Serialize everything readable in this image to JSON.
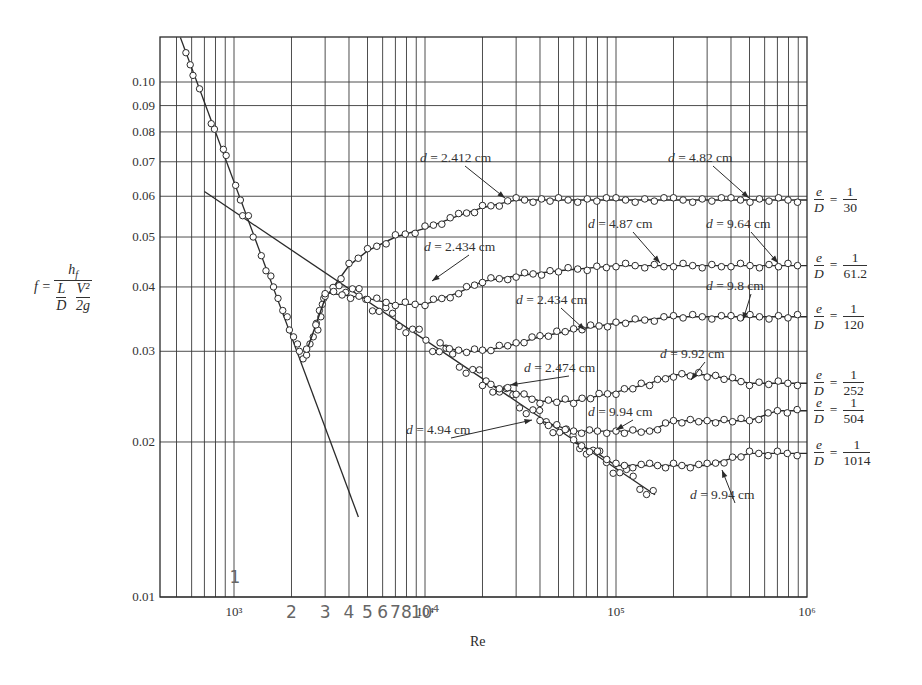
{
  "chart_data": {
    "type": "scatter",
    "title": "",
    "xlabel": "Re",
    "ylabel": "f = h_f / ((L/D)(V^2/2g))",
    "xscale": "log",
    "yscale": "log",
    "xlim": [
      410,
      1000000
    ],
    "ylim": [
      0.01,
      0.122
    ],
    "grid": true,
    "x_ticks": [
      {
        "value": 1000,
        "label": "10³"
      },
      {
        "value": 10000,
        "label": "10⁴"
      },
      {
        "value": 100000,
        "label": "10⁵"
      },
      {
        "value": 1000000,
        "label": "10⁶"
      }
    ],
    "y_ticks": [
      {
        "value": 0.01,
        "label": "0.01"
      },
      {
        "value": 0.02,
        "label": "0.02"
      },
      {
        "value": 0.03,
        "label": "0.03"
      },
      {
        "value": 0.04,
        "label": "0.04"
      },
      {
        "value": 0.05,
        "label": "0.05"
      },
      {
        "value": 0.06,
        "label": "0.06"
      },
      {
        "value": 0.07,
        "label": "0.07"
      },
      {
        "value": 0.08,
        "label": "0.08"
      },
      {
        "value": 0.09,
        "label": "0.09"
      },
      {
        "value": 0.1,
        "label": "0.10"
      }
    ],
    "handwritten_x_marks": [
      "1",
      "2",
      "3",
      "4",
      "5",
      "6",
      "7",
      "8",
      "10⁴"
    ],
    "reference_lines": [
      {
        "name": "laminar f = 64/Re",
        "x": [
          524,
          4480
        ],
        "y": [
          0.122,
          0.0143
        ]
      },
      {
        "name": "Blasius smooth pipe",
        "x": [
          700,
          160000
        ],
        "y": [
          0.0613,
          0.0158
        ]
      }
    ],
    "series": [
      {
        "name": "e/D = 1/30",
        "rhs_num": "1",
        "rhs_den": "30",
        "x": [
          2400,
          3000,
          4000,
          5000,
          7000,
          10000,
          15000,
          20000,
          30000,
          50000,
          100000,
          200000,
          400000,
          1000000
        ],
        "y": [
          0.03,
          0.038,
          0.044,
          0.047,
          0.05,
          0.052,
          0.055,
          0.057,
          0.059,
          0.059,
          0.059,
          0.059,
          0.059,
          0.059
        ]
      },
      {
        "name": "e/D = 1/61.2",
        "rhs_num": "1",
        "rhs_den": "61.2",
        "x": [
          3000,
          5000,
          7000,
          10000,
          15000,
          20000,
          30000,
          50000,
          100000,
          200000,
          400000,
          1000000
        ],
        "y": [
          0.039,
          0.038,
          0.037,
          0.037,
          0.039,
          0.041,
          0.042,
          0.043,
          0.044,
          0.044,
          0.044,
          0.044
        ]
      },
      {
        "name": "e/D = 1/120",
        "rhs_num": "1",
        "rhs_den": "120",
        "x": [
          12000,
          15000,
          20000,
          30000,
          40000,
          60000,
          100000,
          200000,
          400000,
          1000000
        ],
        "y": [
          0.031,
          0.03,
          0.03,
          0.031,
          0.032,
          0.033,
          0.034,
          0.035,
          0.035,
          0.035
        ]
      },
      {
        "name": "e/D = 1/252",
        "rhs_num": "1",
        "rhs_den": "252",
        "x": [
          20000,
          30000,
          40000,
          60000,
          100000,
          150000,
          200000,
          300000,
          500000,
          1000000
        ],
        "y": [
          0.026,
          0.025,
          0.024,
          0.024,
          0.025,
          0.026,
          0.027,
          0.027,
          0.026,
          0.026
        ]
      },
      {
        "name": "e/D = 1/504",
        "rhs_num": "1",
        "rhs_den": "504",
        "x": [
          40000,
          60000,
          80000,
          100000,
          150000,
          200000,
          300000,
          500000,
          700000,
          1000000
        ],
        "y": [
          0.022,
          0.021,
          0.021,
          0.021,
          0.021,
          0.022,
          0.022,
          0.022,
          0.023,
          0.023
        ]
      },
      {
        "name": "e/D = 1/1014",
        "rhs_num": "1",
        "rhs_den": "1014",
        "x": [
          60000,
          80000,
          100000,
          150000,
          200000,
          300000,
          500000,
          700000,
          1000000
        ],
        "y": [
          0.02,
          0.019,
          0.018,
          0.018,
          0.018,
          0.018,
          0.019,
          0.019,
          0.019
        ]
      }
    ],
    "annotations": [
      {
        "text": "d = 2.412 cm",
        "label_x": 420,
        "label_y": 162,
        "arrow_to": [
          505,
          198
        ]
      },
      {
        "text": "d = 4.82 cm",
        "label_x": 668,
        "label_y": 162,
        "arrow_to": [
          749,
          198
        ]
      },
      {
        "text": "d = 4.87 cm",
        "label_x": 588,
        "label_y": 228,
        "arrow_to": [
          660,
          263
        ]
      },
      {
        "text": "d = 9.64 cm",
        "label_x": 706,
        "label_y": 228,
        "arrow_to": [
          778,
          263
        ]
      },
      {
        "text": "d = 2.434 cm",
        "label_x": 424,
        "label_y": 251,
        "arrow_to": [
          432,
          281
        ]
      },
      {
        "text": "d = 9.8 cm",
        "label_x": 706,
        "label_y": 290,
        "arrow_to": [
          743,
          320
        ]
      },
      {
        "text": "d = 2.434 cm",
        "label_x": 516,
        "label_y": 304,
        "arrow_to": [
          585,
          330
        ]
      },
      {
        "text": "d = 9.92 cm",
        "label_x": 660,
        "label_y": 358,
        "arrow_to": [
          691,
          380
        ]
      },
      {
        "text": "d = 2.474 cm",
        "label_x": 524,
        "label_y": 372,
        "arrow_to": [
          510,
          385
        ]
      },
      {
        "text": "d = 9.94 cm",
        "label_x": 588,
        "label_y": 416,
        "arrow_to": [
          616,
          430
        ]
      },
      {
        "text": "d = 4.94 cm",
        "label_x": 406,
        "label_y": 434,
        "arrow_to": [
          532,
          420
        ]
      },
      {
        "text": "d = 9.94 cm",
        "label_x": 690,
        "label_y": 499,
        "arrow_to": [
          722,
          470
        ]
      }
    ]
  },
  "labels": {
    "y_f": "f =",
    "y_num": "h",
    "y_num_sub": "f",
    "y_den_L": "L",
    "y_den_D": "D",
    "y_den_V": "V²",
    "y_den_2g": "2g",
    "ed_e": "e",
    "ed_D": "D",
    "eq": "=",
    "xlabel": "Re"
  },
  "colors": {
    "ink": "#2a2a2a",
    "grid": "#3a3a3a",
    "background": "#ffffff",
    "handwriting": "#777777"
  }
}
